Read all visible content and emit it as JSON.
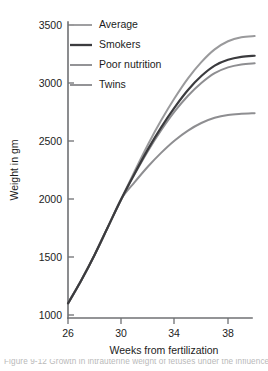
{
  "chart_data": {
    "type": "line",
    "title": "",
    "xlabel": "Weeks from fertilization",
    "ylabel": "Weight in gm",
    "xlim": [
      26,
      40
    ],
    "ylim": [
      1000,
      3500
    ],
    "xticks": [
      26,
      30,
      34,
      38
    ],
    "yticks": [
      1000,
      1500,
      2000,
      2500,
      3000,
      3500
    ],
    "grid": false,
    "legend_position": "top-left",
    "series": [
      {
        "name": "Average",
        "color": "#9a9a9c",
        "width": 2.0,
        "x": [
          26,
          27,
          28,
          29,
          30,
          31,
          32,
          33,
          34,
          35,
          36,
          37,
          38,
          39,
          40
        ],
        "values": [
          1100,
          1300,
          1520,
          1760,
          2000,
          2240,
          2470,
          2680,
          2870,
          3040,
          3180,
          3290,
          3360,
          3395,
          3405
        ]
      },
      {
        "name": "Smokers",
        "color": "#3b3b3e",
        "width": 2.2,
        "x": [
          26,
          27,
          28,
          29,
          30,
          31,
          32,
          33,
          34,
          35,
          36,
          37,
          38,
          39,
          40
        ],
        "values": [
          1100,
          1300,
          1520,
          1760,
          2000,
          2220,
          2430,
          2620,
          2790,
          2940,
          3060,
          3150,
          3200,
          3225,
          3235
        ]
      },
      {
        "name": "Poor nutrition",
        "color": "#8e8e91",
        "width": 2.0,
        "x": [
          26,
          27,
          28,
          29,
          30,
          31,
          32,
          33,
          34,
          35,
          36,
          37,
          38,
          39,
          40
        ],
        "values": [
          1100,
          1300,
          1520,
          1760,
          2000,
          2215,
          2415,
          2595,
          2755,
          2890,
          3000,
          3085,
          3135,
          3160,
          3170
        ]
      },
      {
        "name": "Twins",
        "color": "#8e8e91",
        "width": 2.0,
        "x": [
          26,
          27,
          28,
          29,
          30,
          31,
          32,
          33,
          34,
          35,
          36,
          37,
          38,
          39,
          40
        ],
        "values": [
          1100,
          1300,
          1520,
          1760,
          2000,
          2145,
          2280,
          2400,
          2505,
          2590,
          2655,
          2700,
          2725,
          2735,
          2740
        ]
      }
    ],
    "legend": [
      {
        "label": "Average",
        "color": "#9a9a9c"
      },
      {
        "label": "Smokers",
        "color": "#3b3b3e"
      },
      {
        "label": "Poor nutrition",
        "color": "#8e8e91"
      },
      {
        "label": "Twins",
        "color": "#8e8e91"
      }
    ],
    "tick_labels": {
      "y": [
        "3500",
        "3000",
        "2500",
        "2000",
        "1500",
        "1000"
      ],
      "x": [
        "26",
        "30",
        "34",
        "38"
      ]
    }
  },
  "caption": {
    "text": "Figure  9-12    Growth in intrauterine weight of fetuses under the influence of different maternal factors."
  },
  "colors": {
    "axis": "#6f7073",
    "text": "#1c1c1c",
    "background": "#ffffff"
  }
}
